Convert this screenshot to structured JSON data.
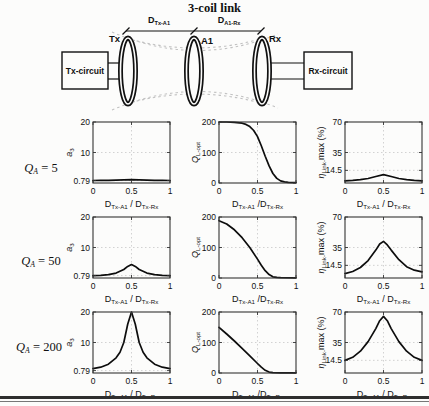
{
  "title": "3-coil link",
  "diagram": {
    "tx_box": "Tx-circuit",
    "rx_box": "Rx-circuit",
    "coils": [
      "Tx",
      "A1",
      "Rx"
    ],
    "dim_labels": [
      {
        "segments": [
          {
            "t": "D"
          },
          {
            "t": "Tx-A1",
            "sub": true
          }
        ]
      },
      {
        "segments": [
          {
            "t": "D"
          },
          {
            "t": "A1-Rx",
            "sub": true
          }
        ]
      }
    ]
  },
  "rows": [
    {
      "segments": [
        {
          "t": "Q",
          "i": true
        },
        {
          "t": "A",
          "sub": true,
          "i": true
        },
        {
          "t": " = 5"
        }
      ]
    },
    {
      "segments": [
        {
          "t": "Q",
          "i": true
        },
        {
          "t": "A",
          "sub": true,
          "i": true
        },
        {
          "t": " = 50"
        }
      ]
    },
    {
      "segments": [
        {
          "t": "Q",
          "i": true
        },
        {
          "t": "A",
          "sub": true,
          "i": true
        },
        {
          "t": " = 200"
        }
      ]
    }
  ],
  "chart_data": [
    {
      "type": "line",
      "qa": 5,
      "ylabel": [
        {
          "t": "a",
          "i": true
        },
        {
          "t": "3",
          "sub": true
        }
      ],
      "xlabel": [
        {
          "t": "D"
        },
        {
          "t": "Tx-A1",
          "sub": true
        },
        {
          "t": " / "
        },
        {
          "t": "D"
        },
        {
          "t": "Tx-Rx",
          "sub": true
        }
      ],
      "xlim": [
        0,
        1
      ],
      "ylim": [
        0,
        20
      ],
      "xticks": [
        {
          "v": 0,
          "l": "0"
        },
        {
          "v": 0.5,
          "l": "0.5"
        },
        {
          "v": 1,
          "l": "1"
        }
      ],
      "yticks": [
        {
          "v": 0.79,
          "l": "0.79"
        },
        {
          "v": 10,
          "l": "10"
        },
        {
          "v": 20,
          "l": "20"
        }
      ],
      "points": [
        [
          0,
          0.82
        ],
        [
          0.1,
          0.84
        ],
        [
          0.2,
          0.88
        ],
        [
          0.3,
          0.95
        ],
        [
          0.4,
          1.05
        ],
        [
          0.5,
          1.1
        ],
        [
          0.6,
          1.05
        ],
        [
          0.7,
          0.95
        ],
        [
          0.8,
          0.88
        ],
        [
          0.9,
          0.84
        ],
        [
          1,
          0.82
        ]
      ]
    },
    {
      "type": "line",
      "qa": 5,
      "ylabel": [
        {
          "t": "Q",
          "i": true
        },
        {
          "t": "L-opt",
          "sub": true
        }
      ],
      "xlabel": [
        {
          "t": "D"
        },
        {
          "t": "Tx-A1",
          "sub": true
        },
        {
          "t": " /"
        },
        {
          "t": "D"
        },
        {
          "t": "Tx-Rx",
          "sub": true
        }
      ],
      "xlim": [
        0,
        1
      ],
      "ylim": [
        0,
        200
      ],
      "xticks": [
        {
          "v": 0,
          "l": "0"
        },
        {
          "v": 0.5,
          "l": "0.5"
        },
        {
          "v": 1,
          "l": "1"
        }
      ],
      "yticks": [
        {
          "v": 0,
          "l": "0"
        },
        {
          "v": 100,
          "l": "100"
        },
        {
          "v": 200,
          "l": "200"
        }
      ],
      "points": [
        [
          0,
          200
        ],
        [
          0.1,
          200
        ],
        [
          0.2,
          199
        ],
        [
          0.3,
          196
        ],
        [
          0.35,
          192
        ],
        [
          0.4,
          185
        ],
        [
          0.45,
          172
        ],
        [
          0.5,
          152
        ],
        [
          0.55,
          122
        ],
        [
          0.6,
          88
        ],
        [
          0.65,
          56
        ],
        [
          0.7,
          31
        ],
        [
          0.75,
          15
        ],
        [
          0.8,
          7
        ],
        [
          0.85,
          4
        ],
        [
          0.9,
          2
        ],
        [
          1,
          1
        ]
      ]
    },
    {
      "type": "line",
      "qa": 5,
      "ylabel": [
        {
          "t": "η",
          "i": true
        },
        {
          "t": "Link-",
          "sub": true
        },
        {
          "t": "max"
        },
        {
          "t": " (%)"
        }
      ],
      "xlabel": [
        {
          "t": "D"
        },
        {
          "t": "Tx-A1",
          "sub": true
        },
        {
          "t": " / "
        },
        {
          "t": "D"
        },
        {
          "t": "Tx-Rx",
          "sub": true
        }
      ],
      "xlim": [
        0,
        1
      ],
      "ylim": [
        0,
        70
      ],
      "xticks": [
        {
          "v": 0,
          "l": "0"
        },
        {
          "v": 0.5,
          "l": "0.5"
        },
        {
          "v": 1,
          "l": "1"
        }
      ],
      "yticks": [
        {
          "v": 14.5,
          "l": "14.5"
        },
        {
          "v": 35,
          "l": "35"
        },
        {
          "v": 70,
          "l": "70"
        }
      ],
      "points": [
        [
          0,
          2.5
        ],
        [
          0.1,
          3
        ],
        [
          0.2,
          3.8
        ],
        [
          0.3,
          5.2
        ],
        [
          0.4,
          7.5
        ],
        [
          0.5,
          9.5
        ],
        [
          0.6,
          7.5
        ],
        [
          0.7,
          5.2
        ],
        [
          0.8,
          3.8
        ],
        [
          0.9,
          3
        ],
        [
          1,
          2.5
        ]
      ]
    },
    {
      "type": "line",
      "qa": 50,
      "ylabel": [
        {
          "t": "a",
          "i": true
        },
        {
          "t": "3",
          "sub": true
        }
      ],
      "xlabel": [
        {
          "t": "D"
        },
        {
          "t": "Tx-A1",
          "sub": true
        },
        {
          "t": " / "
        },
        {
          "t": "D"
        },
        {
          "t": "Tx-Rx",
          "sub": true
        }
      ],
      "xlim": [
        0,
        1
      ],
      "ylim": [
        0,
        20
      ],
      "xticks": [
        {
          "v": 0,
          "l": "0"
        },
        {
          "v": 0.5,
          "l": "0.5"
        },
        {
          "v": 1,
          "l": "1"
        }
      ],
      "yticks": [
        {
          "v": 0.79,
          "l": "0.79"
        },
        {
          "v": 10,
          "l": "10"
        },
        {
          "v": 20,
          "l": "20"
        }
      ],
      "points": [
        [
          0,
          0.8
        ],
        [
          0.1,
          0.9
        ],
        [
          0.2,
          1.1
        ],
        [
          0.3,
          1.6
        ],
        [
          0.4,
          2.8
        ],
        [
          0.45,
          3.8
        ],
        [
          0.5,
          4.4
        ],
        [
          0.55,
          3.8
        ],
        [
          0.6,
          2.8
        ],
        [
          0.7,
          1.6
        ],
        [
          0.8,
          1.1
        ],
        [
          0.9,
          0.9
        ],
        [
          1,
          0.8
        ]
      ]
    },
    {
      "type": "line",
      "qa": 50,
      "ylabel": [
        {
          "t": "Q",
          "i": true
        },
        {
          "t": "L-opt",
          "sub": true
        }
      ],
      "xlabel": [
        {
          "t": "D"
        },
        {
          "t": "Tx-A1",
          "sub": true
        },
        {
          "t": " /"
        },
        {
          "t": "D"
        },
        {
          "t": "Tx-Rx",
          "sub": true
        }
      ],
      "xlim": [
        0,
        1
      ],
      "ylim": [
        0,
        200
      ],
      "xticks": [
        {
          "v": 0,
          "l": "0"
        },
        {
          "v": 0.5,
          "l": "0.5"
        },
        {
          "v": 1,
          "l": "1"
        }
      ],
      "yticks": [
        {
          "v": 0,
          "l": "0"
        },
        {
          "v": 100,
          "l": "100"
        },
        {
          "v": 200,
          "l": "200"
        }
      ],
      "points": [
        [
          0,
          188
        ],
        [
          0.1,
          177
        ],
        [
          0.2,
          158
        ],
        [
          0.3,
          132
        ],
        [
          0.4,
          100
        ],
        [
          0.5,
          62
        ],
        [
          0.55,
          42
        ],
        [
          0.6,
          24
        ],
        [
          0.65,
          11
        ],
        [
          0.7,
          4
        ],
        [
          0.75,
          2
        ],
        [
          0.8,
          1
        ],
        [
          1,
          0.8
        ]
      ]
    },
    {
      "type": "line",
      "qa": 50,
      "ylabel": [
        {
          "t": "η",
          "i": true
        },
        {
          "t": "Link-",
          "sub": true
        },
        {
          "t": "max"
        },
        {
          "t": " (%)"
        }
      ],
      "xlabel": [
        {
          "t": "D"
        },
        {
          "t": "Tx-A1",
          "sub": true
        },
        {
          "t": " / "
        },
        {
          "t": "D"
        },
        {
          "t": "Tx-Rx",
          "sub": true
        }
      ],
      "xlim": [
        0,
        1
      ],
      "ylim": [
        0,
        70
      ],
      "xticks": [
        {
          "v": 0,
          "l": "0"
        },
        {
          "v": 0.5,
          "l": "0.5"
        },
        {
          "v": 1,
          "l": "1"
        }
      ],
      "yticks": [
        {
          "v": 14.5,
          "l": "14.5"
        },
        {
          "v": 35,
          "l": "35"
        },
        {
          "v": 70,
          "l": "70"
        }
      ],
      "points": [
        [
          0,
          5
        ],
        [
          0.1,
          7.5
        ],
        [
          0.2,
          12
        ],
        [
          0.3,
          20
        ],
        [
          0.4,
          32
        ],
        [
          0.45,
          39
        ],
        [
          0.5,
          42
        ],
        [
          0.55,
          38
        ],
        [
          0.6,
          32
        ],
        [
          0.7,
          21
        ],
        [
          0.8,
          13
        ],
        [
          0.9,
          9
        ],
        [
          1,
          7
        ]
      ]
    },
    {
      "type": "line",
      "qa": 200,
      "ylabel": [
        {
          "t": "a",
          "i": true
        },
        {
          "t": "3",
          "sub": true
        }
      ],
      "xlabel": [
        {
          "t": "D"
        },
        {
          "t": "Tx-A1",
          "sub": true
        },
        {
          "t": " / "
        },
        {
          "t": "D"
        },
        {
          "t": "Tx-Rx",
          "sub": true
        }
      ],
      "xlim": [
        0,
        1
      ],
      "ylim": [
        0,
        20
      ],
      "xticks": [
        {
          "v": 0,
          "l": "0"
        },
        {
          "v": 0.5,
          "l": "0.5"
        },
        {
          "v": 1,
          "l": "1"
        }
      ],
      "yticks": [
        {
          "v": 0.79,
          "l": "0.79"
        },
        {
          "v": 10,
          "l": "10"
        },
        {
          "v": 20,
          "l": "20"
        }
      ],
      "points": [
        [
          0,
          1.4
        ],
        [
          0.1,
          1.9
        ],
        [
          0.2,
          2.9
        ],
        [
          0.3,
          5
        ],
        [
          0.35,
          6.8
        ],
        [
          0.4,
          10
        ],
        [
          0.45,
          16
        ],
        [
          0.5,
          20
        ],
        [
          0.55,
          16
        ],
        [
          0.6,
          10
        ],
        [
          0.65,
          6.8
        ],
        [
          0.7,
          5
        ],
        [
          0.8,
          2.9
        ],
        [
          0.9,
          1.9
        ],
        [
          1,
          1.4
        ]
      ]
    },
    {
      "type": "line",
      "qa": 200,
      "ylabel": [
        {
          "t": "Q",
          "i": true
        },
        {
          "t": "L-opt",
          "sub": true
        }
      ],
      "xlabel": [
        {
          "t": "D"
        },
        {
          "t": "Tx-A1",
          "sub": true
        },
        {
          "t": " /"
        },
        {
          "t": "D"
        },
        {
          "t": "Tx-Rx",
          "sub": true
        }
      ],
      "xlim": [
        0,
        1
      ],
      "ylim": [
        0,
        200
      ],
      "xticks": [
        {
          "v": 0,
          "l": "0"
        },
        {
          "v": 0.5,
          "l": "0.5"
        },
        {
          "v": 1,
          "l": "1"
        }
      ],
      "yticks": [
        {
          "v": 0,
          "l": "0"
        },
        {
          "v": 100,
          "l": "100"
        },
        {
          "v": 200,
          "l": "200"
        }
      ],
      "points": [
        [
          0,
          150
        ],
        [
          0.1,
          128
        ],
        [
          0.2,
          105
        ],
        [
          0.3,
          81
        ],
        [
          0.4,
          56
        ],
        [
          0.5,
          31
        ],
        [
          0.55,
          19
        ],
        [
          0.6,
          9
        ],
        [
          0.65,
          3
        ],
        [
          0.7,
          1
        ],
        [
          0.8,
          0.5
        ],
        [
          1,
          0.5
        ]
      ]
    },
    {
      "type": "line",
      "qa": 200,
      "ylabel": [
        {
          "t": "η",
          "i": true
        },
        {
          "t": "Link-",
          "sub": true
        },
        {
          "t": "max"
        },
        {
          "t": " (%)"
        }
      ],
      "xlabel": [
        {
          "t": "D"
        },
        {
          "t": "Tx-A1",
          "sub": true
        },
        {
          "t": " / "
        },
        {
          "t": "D"
        },
        {
          "t": "Tx-Rx",
          "sub": true
        }
      ],
      "xlim": [
        0,
        1
      ],
      "ylim": [
        0,
        70
      ],
      "xticks": [
        {
          "v": 0,
          "l": "0"
        },
        {
          "v": 0.5,
          "l": "0.5"
        },
        {
          "v": 1,
          "l": "1"
        }
      ],
      "yticks": [
        {
          "v": 14.5,
          "l": "14.5"
        },
        {
          "v": 35,
          "l": "35"
        },
        {
          "v": 70,
          "l": "70"
        }
      ],
      "points": [
        [
          0,
          14.5
        ],
        [
          0.1,
          18
        ],
        [
          0.2,
          25
        ],
        [
          0.3,
          36
        ],
        [
          0.4,
          51
        ],
        [
          0.45,
          60
        ],
        [
          0.5,
          65
        ],
        [
          0.55,
          60
        ],
        [
          0.6,
          51
        ],
        [
          0.7,
          36
        ],
        [
          0.8,
          25
        ],
        [
          0.9,
          18
        ],
        [
          1,
          14.5
        ]
      ]
    }
  ]
}
